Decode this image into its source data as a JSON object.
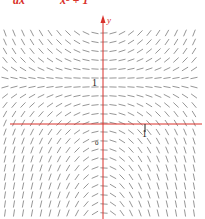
{
  "equation": {
    "lhs": "dx",
    "rhs": "x² + 1"
  },
  "colors": {
    "axis": "#d9312b",
    "segment": "#8a8a8a",
    "text": "#222222"
  },
  "chart_data": {
    "type": "slope_field",
    "xlabel": "",
    "ylabel": "y",
    "tick_labels": {
      "x": [
        "1"
      ],
      "y": [
        "1"
      ],
      "origin": "0"
    },
    "xlim": [
      -2.3,
      2.3
    ],
    "ylim": [
      -2.1,
      2.2
    ],
    "grid": false,
    "pixel_layout": {
      "origin_px": [
        103,
        124
      ],
      "unit_px": 42,
      "col_start_px": 5,
      "col_step_px": 9,
      "cols": 22,
      "row_start_px": 33,
      "row_step_px": 9,
      "rows": 21,
      "segment_half_len_px": 3.6
    },
    "slope_rule": "slope = x*(y-1) (flat along y=1 and x=0; negative above y=1 for x<0, positive above y=1 for x>0; reversed below y=1)"
  }
}
